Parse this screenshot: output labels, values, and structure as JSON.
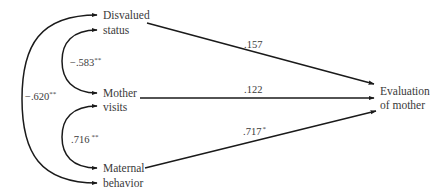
{
  "diagram": {
    "type": "path-model",
    "nodes": {
      "disvalued_status": {
        "line1": "Disvalued",
        "line2": "status"
      },
      "mother_visits": {
        "line1": "Mother",
        "line2": "visits"
      },
      "maternal_behavior": {
        "line1": "Maternal",
        "line2": "behavior"
      },
      "evaluation_of_mother": {
        "line1": "Evaluation",
        "line2": "of mother"
      }
    },
    "correlations": [
      {
        "from": "Disvalued status",
        "to": "Mother visits",
        "value": "−.583",
        "sig": "**"
      },
      {
        "from": "Mother visits",
        "to": "Maternal behavior",
        "value": ".716",
        "sig": "**"
      },
      {
        "from": "Disvalued status",
        "to": "Maternal behavior",
        "value": "−.620",
        "sig": "**"
      }
    ],
    "paths": [
      {
        "from": "Disvalued status",
        "to": "Evaluation of mother",
        "value": ".157",
        "sig": ""
      },
      {
        "from": "Mother visits",
        "to": "Evaluation of mother",
        "value": ".122",
        "sig": ""
      },
      {
        "from": "Maternal behavior",
        "to": "Evaluation of mother",
        "value": ".717",
        "sig": "*"
      }
    ],
    "colors": {
      "line": "#1a1a1a",
      "text": "#3a3a3a",
      "background": "#ffffff"
    }
  }
}
